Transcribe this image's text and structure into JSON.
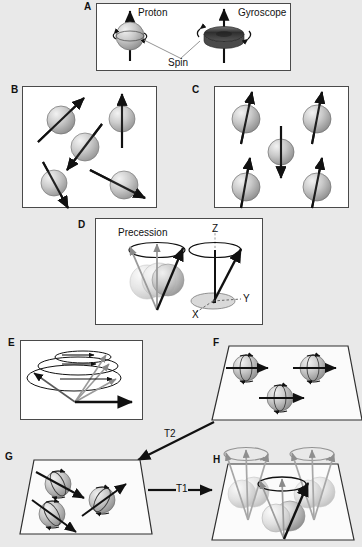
{
  "figure": {
    "background_color": "#e9e9e9",
    "panel_fill": "#ffffff",
    "panel_border": "#4a4a4a",
    "sphere_color": "#b9b9b9",
    "arrow_color": "#111111",
    "gyroscope_color": "#3a3a3a"
  },
  "panels": [
    {
      "id": "A",
      "label": "A",
      "caption": "Proton spin compared to a gyroscope",
      "labels": {
        "proton": "Proton",
        "gyroscope": "Gyroscope",
        "spin": "Spin"
      }
    },
    {
      "id": "B",
      "label": "B",
      "caption": "Randomly oriented proton spins with no external magnetic field",
      "spin_count": 5
    },
    {
      "id": "C",
      "label": "C",
      "caption": "Proton spins aligned parallel and antiparallel in a magnetic field",
      "spin_count": 5,
      "spins_up": 4,
      "spins_down": 1
    },
    {
      "id": "D",
      "label": "D",
      "caption": "Precession of spins about the main magnetic field axis",
      "labels": {
        "precession": "Precession",
        "axis_z": "Z",
        "axis_y": "Y",
        "axis_x": "X"
      }
    },
    {
      "id": "E",
      "label": "E",
      "caption": "Net magnetization vector tipping from longitudinal to transverse plane"
    },
    {
      "id": "F",
      "label": "F",
      "caption": "Spins in phase in the transverse plane immediately after excitation",
      "spin_count": 3
    },
    {
      "id": "G",
      "label": "G",
      "caption": "Spins dephasing in the transverse plane",
      "spin_count": 3
    },
    {
      "id": "H",
      "label": "H",
      "caption": "Longitudinal recovery with spins precessing back toward equilibrium",
      "spin_count": 3
    }
  ],
  "annotations": [
    {
      "id": "t2",
      "label": "T2",
      "meaning": "transverse relaxation",
      "direction": "down-left"
    },
    {
      "id": "t1",
      "label": "T1",
      "meaning": "longitudinal relaxation",
      "direction": "right"
    }
  ]
}
